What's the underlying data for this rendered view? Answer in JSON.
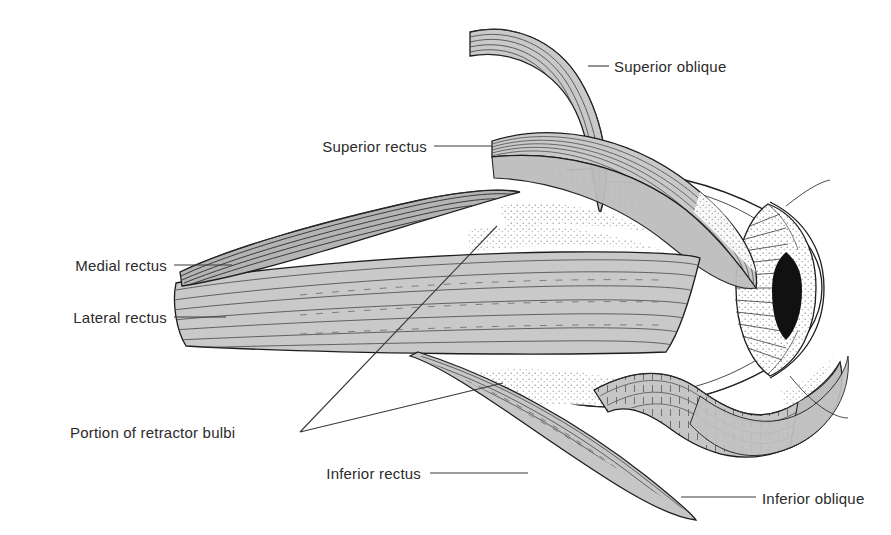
{
  "figure": {
    "background_color": "#ffffff",
    "ink_color": "#1d1d1d",
    "muscle_fill": "#c9c9c9",
    "muscle_fill_dark": "#b0b0b0",
    "sclera_fill": "#ffffff",
    "pupil_color": "#111111",
    "width": 891,
    "height": 535
  },
  "labels": [
    {
      "id": "superior-oblique",
      "text": "Superior oblique",
      "text_x": 614,
      "text_y": 72,
      "anchor": "start",
      "leader": "M 588 66 L 609 66"
    },
    {
      "id": "superior-rectus",
      "text": "Superior rectus",
      "text_x": 427,
      "text_y": 152,
      "anchor": "end",
      "leader": "M 434 146 L 492 146"
    },
    {
      "id": "medial-rectus",
      "text": "Medial rectus",
      "text_x": 167,
      "text_y": 271,
      "anchor": "end",
      "leader": "M 174 265 L 232 265"
    },
    {
      "id": "lateral-rectus",
      "text": "Lateral rectus",
      "text_x": 167,
      "text_y": 323,
      "anchor": "end",
      "leader": "M 174 317 L 226 317"
    },
    {
      "id": "portion-of-retractor-bulbi",
      "text": "Portion of retractor bulbi",
      "text_x": 70,
      "text_y": 438,
      "anchor": "start",
      "leader": "M 300 432 L 497 226 M 300 432 L 503 383"
    },
    {
      "id": "inferior-rectus",
      "text": "Inferior rectus",
      "text_x": 421,
      "text_y": 479,
      "anchor": "end",
      "leader": "M 430 473 L 528 473"
    },
    {
      "id": "inferior-oblique",
      "text": "Inferior oblique",
      "text_x": 762,
      "text_y": 504,
      "anchor": "start",
      "leader": "M 681 497 L 756 497"
    }
  ],
  "structures": [
    {
      "id": "globe",
      "name": "Eyeball / sclera"
    },
    {
      "id": "cornea-iris",
      "name": "Cornea and iris"
    },
    {
      "id": "pupil",
      "name": "Pupil"
    },
    {
      "id": "superior-oblique",
      "name": "Superior oblique muscle"
    },
    {
      "id": "superior-rectus",
      "name": "Superior rectus muscle"
    },
    {
      "id": "medial-rectus",
      "name": "Medial rectus muscle"
    },
    {
      "id": "lateral-rectus",
      "name": "Lateral rectus muscle"
    },
    {
      "id": "inferior-rectus",
      "name": "Inferior rectus muscle"
    },
    {
      "id": "inferior-oblique",
      "name": "Inferior oblique muscle"
    },
    {
      "id": "retractor-bulbi",
      "name": "Retractor bulbi (stippled, deep)"
    }
  ]
}
